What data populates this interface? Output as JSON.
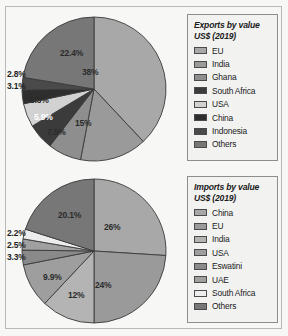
{
  "page": {
    "background_color": "#f7f7f6",
    "frame_color": "#b9b9b7"
  },
  "chart_data": [
    {
      "type": "pie",
      "id": "exports",
      "title": "Exports by value",
      "subtitle": "US$ (2019)",
      "legend_position": "right",
      "categories": [
        "EU",
        "India",
        "Ghana",
        "South Africa",
        "USA",
        "China",
        "Indonesia",
        "Others"
      ],
      "values": [
        38,
        15,
        7.5,
        5.9,
        5.3,
        3.1,
        2.8,
        22.4
      ],
      "labels": [
        "38%",
        "15%",
        "7.5%",
        "5.9%",
        "5.3%",
        "3.1%",
        "2.8%",
        "22.4%"
      ],
      "colors": [
        "#a8a8a8",
        "#9a9a9a",
        "#8e8e8e",
        "#3b3b3b",
        "#d2d2d2",
        "#2e2e2e",
        "#4a4a4a",
        "#777777"
      ]
    },
    {
      "type": "pie",
      "id": "imports",
      "title": "Imports by value",
      "subtitle": "US$ (2019)",
      "legend_position": "right",
      "categories": [
        "China",
        "EU",
        "India",
        "USA",
        "Eswatini",
        "UAE",
        "South Africa",
        "Others"
      ],
      "values": [
        26,
        24,
        12,
        9.9,
        3.3,
        2.5,
        2.2,
        20.1
      ],
      "labels": [
        "26%",
        "24%",
        "12%",
        "9.9%",
        "3.3%",
        "2.5%",
        "2.2%",
        "20.1%"
      ],
      "colors": [
        "#a8a8a8",
        "#9a9a9a",
        "#b4b4b4",
        "#9e9e9e",
        "#8a8a8a",
        "#a0a0a0",
        "#ededed",
        "#777777"
      ]
    }
  ],
  "exports": {
    "legend": {
      "title": "Exports by value",
      "subtitle": "US$ (2019)",
      "items": [
        {
          "label": "EU",
          "color": "#a8a8a8"
        },
        {
          "label": "India",
          "color": "#9a9a9a"
        },
        {
          "label": "Ghana",
          "color": "#8e8e8e"
        },
        {
          "label": "South Africa",
          "color": "#3b3b3b"
        },
        {
          "label": "USA",
          "color": "#d2d2d2"
        },
        {
          "label": "China",
          "color": "#2e2e2e"
        },
        {
          "label": "Indonesia",
          "color": "#4a4a4a"
        },
        {
          "label": "Others",
          "color": "#777777"
        }
      ]
    },
    "pie_labels": {
      "eu": "38%",
      "india": "15%",
      "ghana": "7.5%",
      "south_africa": "5.9%",
      "usa": "5.3%",
      "china": "3.1%",
      "indonesia": "2.8%",
      "others": "22.4%"
    }
  },
  "imports": {
    "legend": {
      "title": "Imports by value",
      "subtitle": "US$ (2019)",
      "items": [
        {
          "label": "China",
          "color": "#a8a8a8"
        },
        {
          "label": "EU",
          "color": "#9a9a9a"
        },
        {
          "label": "India",
          "color": "#b4b4b4"
        },
        {
          "label": "USA",
          "color": "#9e9e9e"
        },
        {
          "label": "Eswatini",
          "color": "#8a8a8a"
        },
        {
          "label": "UAE",
          "color": "#a0a0a0"
        },
        {
          "label": "South Africa",
          "color": "#ededed"
        },
        {
          "label": "Others",
          "color": "#777777"
        }
      ]
    },
    "pie_labels": {
      "china": "26%",
      "eu": "24%",
      "india": "12%",
      "usa": "9.9%",
      "eswatini": "3.3%",
      "uae": "2.5%",
      "south_africa": "2.2%",
      "others": "20.1%"
    }
  }
}
